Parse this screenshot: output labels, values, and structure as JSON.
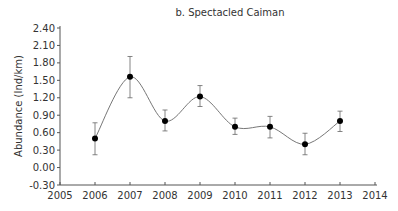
{
  "chart_data": {
    "type": "line",
    "title": "b. Spectacled Caiman",
    "xlabel": "",
    "ylabel": "Abundance (Ind/km)",
    "x": [
      2006,
      2007,
      2008,
      2009,
      2010,
      2011,
      2012,
      2013
    ],
    "series": [
      {
        "name": "Spectacled Caiman",
        "values": [
          0.5,
          1.56,
          0.8,
          1.22,
          0.7,
          0.7,
          0.4,
          0.8
        ],
        "error_low": [
          0.22,
          1.2,
          0.63,
          1.05,
          0.57,
          0.51,
          0.22,
          0.62
        ],
        "error_high": [
          0.77,
          1.91,
          0.99,
          1.41,
          0.85,
          0.88,
          0.59,
          0.97
        ],
        "style": "smoothed line with markers and error bars",
        "color": "#000000"
      }
    ],
    "xlim": [
      2005,
      2014
    ],
    "ylim": [
      -0.3,
      2.4
    ],
    "xticks": [
      "2005",
      "2006",
      "2007",
      "2008",
      "2009",
      "2010",
      "2011",
      "2012",
      "2013",
      "2014"
    ],
    "yticks": [
      "-0.30",
      "0.00",
      "0.30",
      "0.60",
      "0.90",
      "1.20",
      "1.50",
      "1.80",
      "2.10",
      "2.40"
    ],
    "grid": false,
    "legend": null
  },
  "colors": {
    "line": "#777777",
    "marker": "#000000",
    "axis": "#555555",
    "errorbar": "#666666"
  }
}
